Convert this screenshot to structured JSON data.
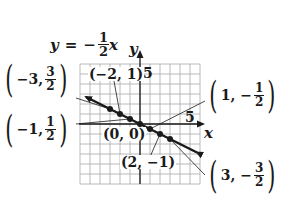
{
  "equation": {
    "lhs": "y",
    "eq": "=",
    "sign": "−",
    "num": "1",
    "den": "2",
    "var": "x"
  },
  "axes": {
    "x_label": "x",
    "y_label": "y",
    "x_tick_label": "5",
    "y_tick_label": "5",
    "range": [
      -6,
      6
    ]
  },
  "labels": {
    "p_m3": {
      "x": "−3,",
      "num": "3",
      "den": "2"
    },
    "p_m1": {
      "x": "−1,",
      "num": "1",
      "den": "2"
    },
    "p_1": {
      "x": "1, −",
      "num": "1",
      "den": "2"
    },
    "p_3": {
      "x": "3, −",
      "num": "3",
      "den": "2"
    },
    "p_m2": "(−2, 1)",
    "p_0": "(0, 0)",
    "p_2": "(2, −1)"
  },
  "colors": {
    "line": "#1a1a1a",
    "grid": "#9a9a9a",
    "background": "#ffffff"
  },
  "chart_data": {
    "type": "line",
    "xlabel": "x",
    "ylabel": "y",
    "xlim": [
      -6,
      6
    ],
    "ylim": [
      -6,
      6
    ],
    "grid": true,
    "series": [
      {
        "name": "y = -1/2 x",
        "x": [
          -3,
          -2,
          -1,
          0,
          1,
          2,
          3
        ],
        "y": [
          1.5,
          1,
          0.5,
          0,
          -0.5,
          -1,
          -1.5
        ]
      }
    ],
    "annotations": [
      "(-3, 3/2)",
      "(-2, 1)",
      "(-1, 1/2)",
      "(0, 0)",
      "(1, -1/2)",
      "(2, -1)",
      "(3, -3/2)"
    ]
  }
}
